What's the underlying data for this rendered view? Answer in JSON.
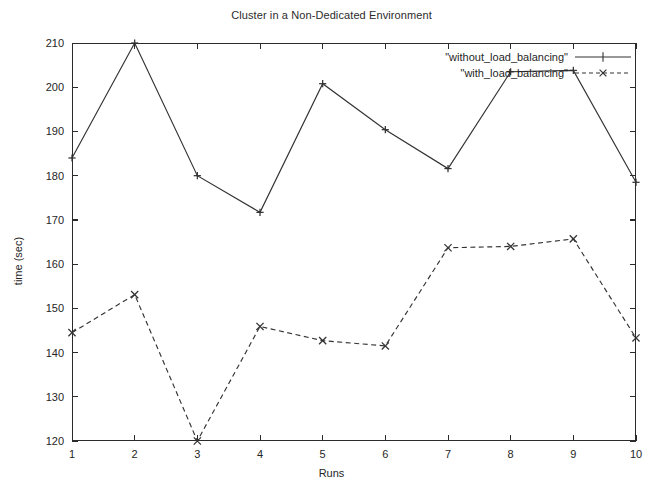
{
  "chart_data": {
    "type": "line",
    "title": "Cluster in a Non-Dedicated Environment",
    "xlabel": "Runs",
    "ylabel": "time (sec)",
    "x": [
      1,
      2,
      3,
      4,
      5,
      6,
      7,
      8,
      9,
      10
    ],
    "xticklabels": [
      "1",
      "2",
      "3",
      "4",
      "5",
      "6",
      "7",
      "8",
      "9",
      "10"
    ],
    "yticklabels": [
      "120",
      "130",
      "140",
      "150",
      "160",
      "170",
      "180",
      "190",
      "200",
      "210"
    ],
    "yticks": [
      120,
      130,
      140,
      150,
      160,
      170,
      180,
      190,
      200,
      210
    ],
    "xlim": [
      1,
      10
    ],
    "ylim": [
      120,
      210
    ],
    "grid": false,
    "legend_position": "top-right",
    "series": [
      {
        "name": "\"without_load_balancing\"",
        "marker": "plus",
        "linestyle": "solid",
        "color": "#333333",
        "values": [
          184.0,
          210.0,
          180.0,
          171.7,
          200.8,
          190.4,
          181.6,
          203.5,
          203.8,
          178.5
        ]
      },
      {
        "name": "\"with_load_balancing\"",
        "marker": "cross",
        "linestyle": "dashed",
        "color": "#333333",
        "values": [
          144.5,
          153.1,
          120.0,
          145.9,
          142.7,
          141.5,
          163.7,
          164.0,
          165.7,
          143.3
        ]
      }
    ]
  },
  "legend": {
    "entries": [
      {
        "label": "\"without_load_balancing\""
      },
      {
        "label": "\"with_load_balancing\""
      }
    ]
  }
}
